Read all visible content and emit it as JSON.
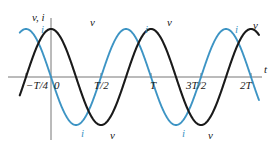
{
  "figure": {
    "axis_labels": {
      "vertical": "v, i",
      "horizontal": "t"
    },
    "tick_labels": [
      {
        "text": "−T/4",
        "x": 26
      },
      {
        "text": "0",
        "x": 54
      },
      {
        "text": "T/2",
        "x": 94
      },
      {
        "text": "T",
        "x": 150
      },
      {
        "text": "3T/2",
        "x": 186
      },
      {
        "text": "2T",
        "x": 240
      }
    ],
    "curve_labels": [
      {
        "text": "i",
        "x": 41,
        "y": 24,
        "color": "blue"
      },
      {
        "text": "v",
        "x": 90,
        "y": 17,
        "color": "black"
      },
      {
        "text": "i",
        "x": 145,
        "y": 24,
        "color": "blue"
      },
      {
        "text": "v",
        "x": 167,
        "y": 17,
        "color": "black"
      },
      {
        "text": "i",
        "x": 235,
        "y": 24,
        "color": "blue"
      },
      {
        "text": "v",
        "x": 253,
        "y": 20,
        "color": "black"
      },
      {
        "text": "i",
        "x": 81,
        "y": 128,
        "color": "blue"
      },
      {
        "text": "v",
        "x": 110,
        "y": 130,
        "color": "black"
      },
      {
        "text": "i",
        "x": 182,
        "y": 128,
        "color": "blue"
      },
      {
        "text": "v",
        "x": 208,
        "y": 130,
        "color": "black"
      }
    ],
    "colors": {
      "current_curve": "#3d94c4",
      "voltage_curve": "#1a1a1a",
      "axis": "#777777"
    }
  },
  "chart_data": {
    "type": "line",
    "title": "",
    "xlabel": "t",
    "ylabel": "v, i",
    "grid": false,
    "legend": "inline-curve-labels",
    "xlim": [
      -0.3125,
      2.08
    ],
    "ylim": [
      -1.15,
      1.15
    ],
    "x_tick_values": [
      -0.25,
      0,
      0.5,
      1,
      1.5,
      2
    ],
    "x_tick_labels": [
      "−T/4",
      "0",
      "T/2",
      "T",
      "3T/2",
      "2T"
    ],
    "y_tick_values": [],
    "y_tick_labels": [],
    "series": [
      {
        "name": "i",
        "label": "i",
        "color": "#3d94c4",
        "form": "cos(2*pi*t/T + pi/2)",
        "amplitude": 1.0,
        "period_in_T": 1.0,
        "phase_deg": 90,
        "phase_in_T": 0.25,
        "peak_positions_in_T": [
          -0.25,
          0.75,
          1.75
        ],
        "trough_positions_in_T": [
          0.25,
          1.25
        ],
        "zero_crossings_in_T": [
          0.0,
          0.5,
          1.0,
          1.5,
          2.0
        ]
      },
      {
        "name": "v",
        "label": "v",
        "color": "#1a1a1a",
        "form": "cos(2*pi*t/T)",
        "amplitude": 1.0,
        "period_in_T": 1.0,
        "phase_deg": 0,
        "phase_in_T": 0.0,
        "peak_positions_in_T": [
          0.0,
          1.0,
          2.0
        ],
        "trough_positions_in_T": [
          0.5,
          1.5
        ],
        "zero_crossings_in_T": [
          -0.25,
          0.25,
          0.75,
          1.25,
          1.75
        ]
      }
    ]
  }
}
